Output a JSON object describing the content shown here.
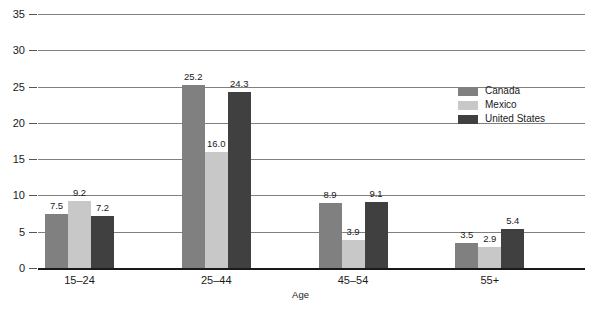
{
  "chart_data": {
    "type": "bar",
    "title": "",
    "subtitle": "",
    "xlabel": "Age",
    "ylabel": "",
    "categories": [
      "15–24",
      "25–44",
      "45–54",
      "55+"
    ],
    "series": [
      {
        "name": "Canada",
        "color": "#808080",
        "values": [
          7.5,
          25.2,
          8.9,
          3.5
        ]
      },
      {
        "name": "Mexico",
        "color": "#c8c8c8",
        "values": [
          9.2,
          16.0,
          3.9,
          2.9
        ]
      },
      {
        "name": "United States",
        "color": "#404040",
        "values": [
          7.2,
          24.3,
          9.1,
          5.4
        ]
      }
    ],
    "value_labels": [
      [
        "7.5",
        "25.2",
        "8.9",
        "3.5"
      ],
      [
        "9.2",
        "16.0",
        "3.9",
        "2.9"
      ],
      [
        "7.2",
        "24.3",
        "9.1",
        "5.4"
      ]
    ],
    "ylim": [
      0,
      35
    ],
    "yticks": [
      0,
      5,
      10,
      15,
      20,
      25,
      30,
      35
    ],
    "ytick_labels": [
      "0",
      "5",
      "10",
      "15",
      "20",
      "25",
      "30",
      "35"
    ],
    "grid": true,
    "grid_axis": "y",
    "legend_position": "right-upper",
    "legend": [
      "Canada",
      "Mexico",
      "United States"
    ]
  }
}
